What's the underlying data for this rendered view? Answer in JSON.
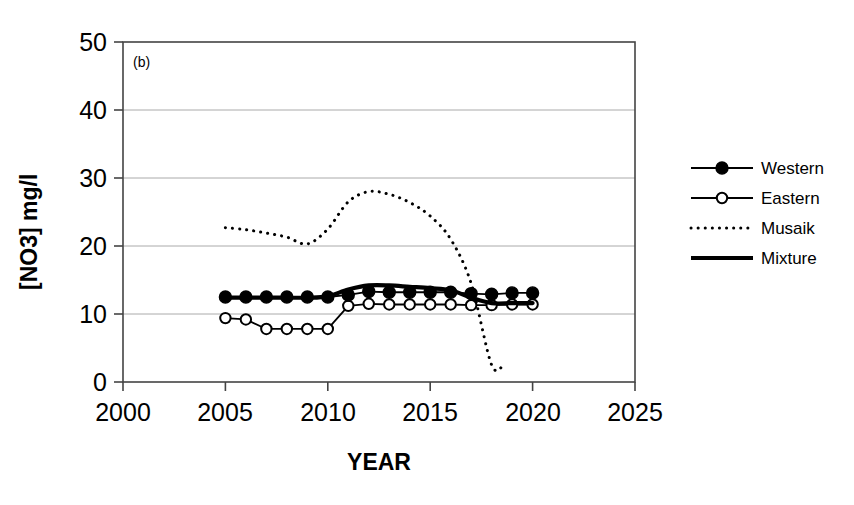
{
  "chart_data": {
    "type": "line",
    "title": "",
    "panel_label": "(b)",
    "xlabel": "YEAR",
    "ylabel": "[NO3] mg/l",
    "xlim": [
      2000,
      2025
    ],
    "ylim": [
      0,
      50
    ],
    "xticks": [
      2000,
      2005,
      2010,
      2015,
      2020,
      2025
    ],
    "yticks": [
      0,
      10,
      20,
      30,
      40,
      50
    ],
    "grid": "horizontal",
    "legend_position": "right",
    "series": [
      {
        "name": "Western",
        "style": "solid-with-filled-circle-markers",
        "color": "#000000",
        "x": [
          2005,
          2006,
          2007,
          2008,
          2009,
          2010,
          2011,
          2012,
          2013,
          2014,
          2015,
          2016,
          2017,
          2018,
          2019,
          2020
        ],
        "values": [
          12.5,
          12.5,
          12.5,
          12.5,
          12.5,
          12.5,
          12.8,
          13.3,
          13.2,
          13.2,
          13.2,
          13.2,
          13.0,
          12.9,
          13.1,
          13.1
        ]
      },
      {
        "name": "Eastern",
        "style": "solid-with-open-circle-markers",
        "color": "#000000",
        "x": [
          2005,
          2006,
          2007,
          2008,
          2009,
          2010,
          2011,
          2012,
          2013,
          2014,
          2015,
          2016,
          2017,
          2018,
          2019,
          2020
        ],
        "values": [
          9.4,
          9.2,
          7.8,
          7.8,
          7.8,
          7.8,
          11.2,
          11.5,
          11.4,
          11.4,
          11.4,
          11.4,
          11.3,
          11.3,
          11.4,
          11.4
        ]
      },
      {
        "name": "Musaik",
        "style": "dotted",
        "color": "#000000",
        "x": [
          2005,
          2006,
          2007,
          2008,
          2009,
          2010,
          2011,
          2012,
          2013,
          2014,
          2015,
          2016,
          2017,
          2018,
          2018.6
        ],
        "values": [
          22.7,
          22.4,
          21.9,
          21.3,
          20.3,
          22.5,
          26.5,
          28.0,
          27.6,
          26.4,
          24.4,
          21.0,
          14.5,
          2.5,
          2.6
        ]
      },
      {
        "name": "Mixture",
        "style": "thick-solid",
        "color": "#000000",
        "x": [
          2005,
          2006,
          2007,
          2008,
          2009,
          2010,
          2011,
          2012,
          2013,
          2014,
          2015,
          2016,
          2017,
          2018,
          2019,
          2020
        ],
        "values": [
          12.4,
          12.4,
          12.4,
          12.4,
          12.4,
          12.6,
          13.6,
          14.2,
          14.2,
          14.0,
          13.8,
          13.5,
          12.4,
          11.6,
          11.6,
          11.6
        ]
      }
    ]
  },
  "legend": {
    "items": [
      {
        "label": "Western",
        "marker": "filled-circle"
      },
      {
        "label": "Eastern",
        "marker": "open-circle"
      },
      {
        "label": "Musaik",
        "marker": "dotted-line"
      },
      {
        "label": "Mixture",
        "marker": "thick-line"
      }
    ]
  },
  "axes": {
    "y_tick_labels": [
      "50",
      "40",
      "30",
      "20",
      "10",
      "0"
    ],
    "x_tick_labels": [
      "2000",
      "2005",
      "2010",
      "2015",
      "2020",
      "2025"
    ],
    "y_title": "[NO3] mg/l",
    "x_title": "YEAR"
  }
}
